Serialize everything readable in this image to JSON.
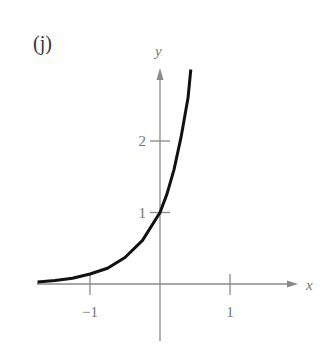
{
  "panel_label": "(j)",
  "chart_data": {
    "type": "line",
    "title": "(j)",
    "xlabel": "x",
    "ylabel": "y",
    "xlim": [
      -1.75,
      2.1
    ],
    "ylim": [
      -0.8,
      3.2
    ],
    "grid": false,
    "x_ticks": [
      {
        "value": -1,
        "label": "−1"
      },
      {
        "value": 1,
        "label": "1"
      }
    ],
    "y_ticks": [
      {
        "value": 1,
        "label": "1"
      },
      {
        "value": 2,
        "label": "2"
      }
    ],
    "series": [
      {
        "name": "curve",
        "color": "#111111",
        "x": [
          -1.75,
          -1.5,
          -1.25,
          -1.0,
          -0.75,
          -0.5,
          -0.25,
          0.0,
          0.1,
          0.2,
          0.3,
          0.4,
          0.44
        ],
        "y": [
          0.03,
          0.05,
          0.08,
          0.14,
          0.22,
          0.37,
          0.61,
          1.0,
          1.26,
          1.6,
          2.05,
          2.6,
          3.0
        ]
      }
    ],
    "annotations": []
  },
  "colors": {
    "axis": "#8a8a8a",
    "curve": "#111111",
    "text": "#777777"
  }
}
